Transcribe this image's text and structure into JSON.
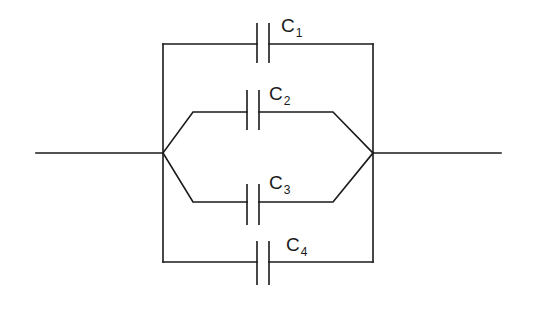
{
  "diagram": {
    "type": "circuit",
    "stroke_color": "#1a1a1a",
    "background": "#ffffff",
    "components": [
      {
        "id": "C1",
        "symbol": "C",
        "subscript": "1",
        "kind": "capacitor",
        "branch": "outer-top"
      },
      {
        "id": "C2",
        "symbol": "C",
        "subscript": "2",
        "kind": "capacitor",
        "branch": "inner-top"
      },
      {
        "id": "C3",
        "symbol": "C",
        "subscript": "3",
        "kind": "capacitor",
        "branch": "inner-bottom"
      },
      {
        "id": "C4",
        "symbol": "C",
        "subscript": "4",
        "kind": "capacitor",
        "branch": "outer-bottom"
      }
    ],
    "nodes": [
      {
        "id": "left-junction"
      },
      {
        "id": "right-junction"
      }
    ]
  }
}
